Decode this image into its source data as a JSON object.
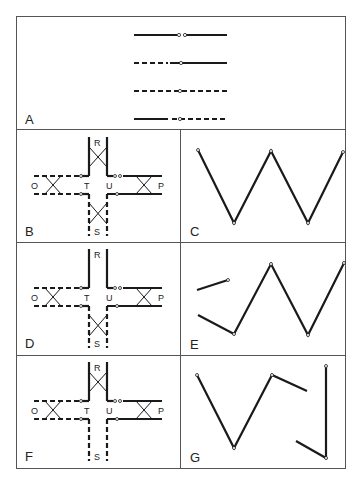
{
  "figure": {
    "panels": {
      "A": {
        "label": "A",
        "description": "Four line-type legends: solid-solid, dashed-solid, dashed-dashed, solid-dashed joined at open circle"
      },
      "B": {
        "label": "B",
        "nodes": {
          "R": "R",
          "S": "S",
          "O": "O",
          "P": "P",
          "T": "T",
          "U": "U"
        }
      },
      "C": {
        "label": "C"
      },
      "D": {
        "label": "D",
        "nodes": {
          "R": "R",
          "S": "S",
          "O": "O",
          "P": "P",
          "T": "T",
          "U": "U"
        }
      },
      "E": {
        "label": "E"
      },
      "F": {
        "label": "F",
        "nodes": {
          "R": "R",
          "S": "S",
          "O": "O",
          "P": "P",
          "T": "T",
          "U": "U"
        }
      },
      "G": {
        "label": "G"
      }
    },
    "colors": {
      "ink": "#1a1a1a",
      "border": "#555555",
      "background": "#ffffff"
    }
  }
}
